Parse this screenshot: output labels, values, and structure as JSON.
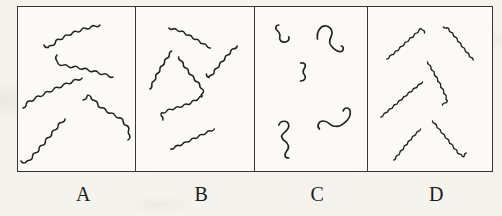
{
  "figure": {
    "style": {
      "page_bg": "#f4f3ee",
      "panel_bg": "#fbfaf6",
      "border_color": "#393631",
      "stroke": "#242220"
    },
    "panel_height": 164,
    "panels": [
      {
        "label": "A",
        "width": 117,
        "stroke_width": 1.5,
        "strands": [
          {
            "kind": "wavy",
            "amp": 2.2,
            "wl": 10,
            "pts": [
              [
                26,
                38
              ],
              [
                31,
                41
              ],
              [
                40,
                33
              ],
              [
                52,
                27
              ],
              [
                66,
                22
              ],
              [
                82,
                18
              ]
            ]
          },
          {
            "kind": "wavy",
            "amp": 2.0,
            "wl": 10,
            "pts": [
              [
                39,
                48
              ],
              [
                38,
                56
              ],
              [
                48,
                59
              ],
              [
                62,
                61
              ],
              [
                78,
                65
              ],
              [
                95,
                70
              ]
            ]
          },
          {
            "kind": "wavy",
            "amp": 2.2,
            "wl": 10,
            "pts": [
              [
                5,
                101
              ],
              [
                9,
                96
              ],
              [
                18,
                91
              ],
              [
                32,
                84
              ],
              [
                48,
                77
              ],
              [
                64,
                71
              ]
            ]
          },
          {
            "kind": "wavy",
            "amp": 2.0,
            "wl": 10,
            "pts": [
              [
                65,
                93
              ],
              [
                71,
                88
              ],
              [
                75,
                92
              ],
              [
                82,
                100
              ],
              [
                92,
                106
              ],
              [
                102,
                111
              ],
              [
                109,
                119
              ],
              [
                112,
                127
              ],
              [
                110,
                133
              ]
            ]
          },
          {
            "kind": "wavy",
            "amp": 2.2,
            "wl": 10,
            "pts": [
              [
                3,
                154
              ],
              [
                9,
                156
              ],
              [
                14,
                150
              ],
              [
                22,
                141
              ],
              [
                31,
                130
              ],
              [
                40,
                119
              ],
              [
                47,
                112
              ]
            ]
          }
        ]
      },
      {
        "label": "B",
        "width": 119,
        "stroke_width": 1.5,
        "strands": [
          {
            "kind": "wavy",
            "amp": 1.7,
            "wl": 8.5,
            "pts": [
              [
                33,
                21
              ],
              [
                45,
                24
              ],
              [
                58,
                31
              ],
              [
                75,
                41
              ]
            ]
          },
          {
            "kind": "wavy",
            "amp": 1.7,
            "wl": 8.5,
            "pts": [
              [
                14,
                82
              ],
              [
                17,
                76
              ],
              [
                22,
                66
              ],
              [
                28,
                56
              ],
              [
                34,
                47
              ],
              [
                36,
                44
              ]
            ]
          },
          {
            "kind": "wavy",
            "amp": 1.7,
            "wl": 8.5,
            "pts": [
              [
                71,
                67
              ],
              [
                74,
                71
              ],
              [
                80,
                63
              ],
              [
                88,
                53
              ],
              [
                96,
                44
              ],
              [
                102,
                39
              ]
            ]
          },
          {
            "kind": "wavy",
            "amp": 1.7,
            "wl": 8.5,
            "pts": [
              [
                43,
                50
              ],
              [
                48,
                58
              ],
              [
                54,
                66
              ],
              [
                60,
                73
              ],
              [
                65,
                79
              ],
              [
                68,
                85
              ],
              [
                66,
                90
              ]
            ]
          },
          {
            "kind": "wavy",
            "amp": 1.7,
            "wl": 8.5,
            "pts": [
              [
                27,
                113
              ],
              [
                25,
                107
              ],
              [
                33,
                103
              ],
              [
                44,
                100
              ],
              [
                55,
                96
              ],
              [
                67,
                89
              ]
            ]
          },
          {
            "kind": "wavy",
            "amp": 1.6,
            "wl": 8.5,
            "pts": [
              [
                35,
                142
              ],
              [
                49,
                136
              ],
              [
                64,
                129
              ],
              [
                79,
                122
              ]
            ]
          }
        ]
      },
      {
        "label": "C",
        "width": 113,
        "stroke_width": 1.7,
        "strands": [
          {
            "kind": "path",
            "d": "M 24,18 C 21,18 20,21 22,23 C 24,25 26,27 25,30 C 24,33 27,36 31,35 C 34,34 35,32 34,30"
          },
          {
            "kind": "path",
            "d": "M 63,32 C 62,25 66,18 72,19 C 77,20 79,25 77,29 C 75,33 74,36 77,39 C 80,43 85,46 88,44 C 90,42 89,39 87,39"
          },
          {
            "kind": "path",
            "d": "M 46,56 C 50,55 52,58 50,61 C 48,64 48,66 50,68 C 52,71 50,74 46,74"
          },
          {
            "kind": "path",
            "d": "M 24,118 C 26,113 33,113 34,118 C 35,122 31,124 28,127 C 26,129 27,132 30,134 C 34,136 35,141 32,144 C 29,148 30,151 34,151"
          },
          {
            "kind": "path",
            "d": "M 65,122 C 62,119 64,114 69,114 C 74,114 75,118 79,119 C 83,120 87,119 90,116 C 94,113 97,109 96,104 C 95,100 90,100 89,104"
          }
        ]
      },
      {
        "label": "D",
        "width": 125,
        "stroke_width": 1.4,
        "strands": [
          {
            "kind": "wavy",
            "amp": 1.3,
            "wl": 6.5,
            "pts": [
              [
                19,
                52
              ],
              [
                30,
                43
              ],
              [
                41,
                33
              ],
              [
                50,
                25
              ],
              [
                54,
                21
              ],
              [
                57,
                26
              ]
            ]
          },
          {
            "kind": "wavy",
            "amp": 1.3,
            "wl": 6.5,
            "pts": [
              [
                76,
                20
              ],
              [
                80,
                21
              ],
              [
                88,
                30
              ],
              [
                97,
                42
              ],
              [
                106,
                53
              ]
            ]
          },
          {
            "kind": "wavy",
            "amp": 1.3,
            "wl": 6.5,
            "pts": [
              [
                60,
                55
              ],
              [
                66,
                65
              ],
              [
                72,
                76
              ],
              [
                78,
                88
              ],
              [
                80,
                94
              ],
              [
                75,
                98
              ]
            ]
          },
          {
            "kind": "wavy",
            "amp": 1.2,
            "wl": 6.5,
            "pts": [
              [
                13,
                110
              ],
              [
                26,
                99
              ],
              [
                40,
                87
              ],
              [
                55,
                75
              ]
            ]
          },
          {
            "kind": "wavy",
            "amp": 1.2,
            "wl": 6.5,
            "pts": [
              [
                26,
                153
              ],
              [
                31,
                147
              ],
              [
                39,
                137
              ],
              [
                47,
                128
              ],
              [
                53,
                122
              ]
            ]
          },
          {
            "kind": "wavy",
            "amp": 1.3,
            "wl": 6.5,
            "pts": [
              [
                65,
                114
              ],
              [
                74,
                125
              ],
              [
                83,
                136
              ],
              [
                91,
                146
              ],
              [
                96,
                150
              ],
              [
                99,
                146
              ]
            ]
          }
        ]
      }
    ]
  }
}
